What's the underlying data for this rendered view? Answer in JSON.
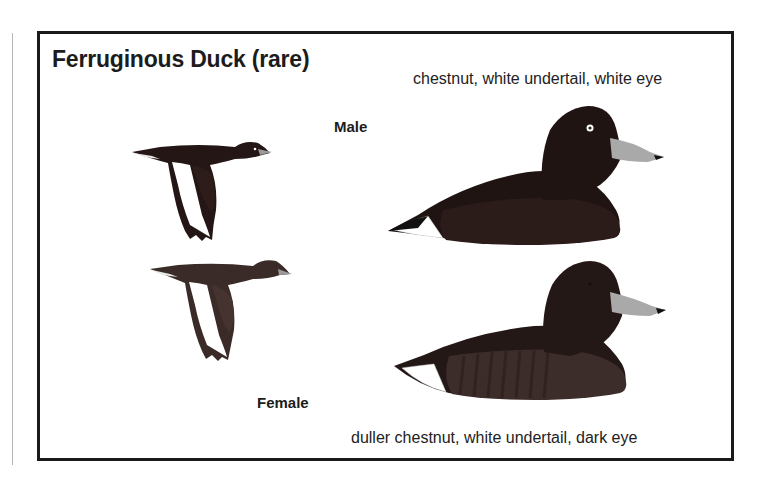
{
  "plate": {
    "title": "Ferruginous Duck (rare)",
    "male": {
      "label": "Male",
      "caption": "chestnut, white undertail, white eye"
    },
    "female": {
      "label": "Female",
      "caption": "duller chestnut, white undertail, dark eye"
    }
  },
  "colors": {
    "border": "#1a1a1a",
    "male_body": "#2a1a18",
    "female_body": "#3a2c28",
    "bill": "#a9a9a9",
    "undertail": "#ffffff"
  },
  "illustrations": [
    {
      "name": "male-flying-duck",
      "sex": "Male",
      "pose": "flying"
    },
    {
      "name": "male-swimming-duck",
      "sex": "Male",
      "pose": "swimming"
    },
    {
      "name": "female-flying-duck",
      "sex": "Female",
      "pose": "flying"
    },
    {
      "name": "female-swimming-duck",
      "sex": "Female",
      "pose": "swimming"
    }
  ]
}
